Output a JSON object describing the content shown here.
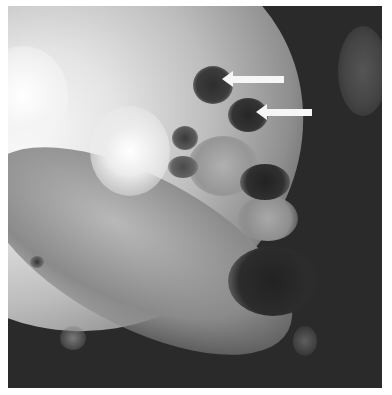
{
  "image": {
    "kind": "grayscale fluorescence micrograph",
    "background_color": "#ffffff",
    "colors": {
      "bright": "#f2f2f2",
      "mid": "#9a9a9a",
      "dark": "#2a2a2a",
      "arrow": "#f6f6f6"
    }
  },
  "annotations": {
    "arrows": [
      {
        "label": "arrow-1",
        "direction": "left",
        "tip": [
          225,
          80
        ],
        "tail": [
          284,
          80
        ]
      },
      {
        "label": "arrow-2",
        "direction": "left",
        "tip": [
          259,
          113
        ],
        "tail": [
          312,
          113
        ]
      }
    ]
  }
}
